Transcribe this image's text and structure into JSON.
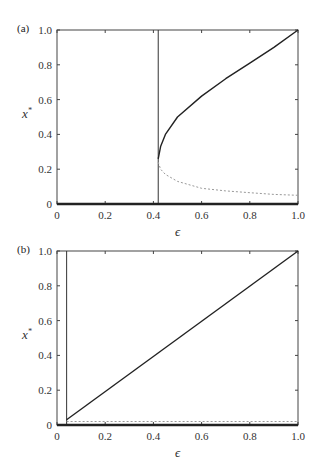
{
  "chart_data": [
    {
      "type": "line",
      "panel_label": "(a)",
      "xlabel": "ϵ",
      "ylabel": "x*",
      "xlim": [
        0,
        1.0
      ],
      "ylim": [
        0,
        1.0
      ],
      "x_ticks": [
        "0",
        "0.2",
        "0.4",
        "0.6",
        "0.8",
        "1.0"
      ],
      "y_ticks": [
        "0",
        "0.2",
        "0.4",
        "0.6",
        "0.8",
        "1.0"
      ],
      "grid": false,
      "vertical_line_x": 0.42,
      "series": [
        {
          "name": "stable branch (solid)",
          "style": "solid",
          "x": [
            0.42,
            0.43,
            0.45,
            0.5,
            0.6,
            0.7,
            0.8,
            0.9,
            1.0
          ],
          "y": [
            0.26,
            0.33,
            0.4,
            0.5,
            0.62,
            0.72,
            0.81,
            0.9,
            1.0
          ]
        },
        {
          "name": "unstable branch (dashed)",
          "style": "dashed",
          "x": [
            0.42,
            0.43,
            0.45,
            0.5,
            0.6,
            0.7,
            0.8,
            0.9,
            1.0
          ],
          "y": [
            0.24,
            0.2,
            0.17,
            0.13,
            0.09,
            0.075,
            0.065,
            0.055,
            0.05
          ]
        },
        {
          "name": "zero branch (solid)",
          "style": "solid",
          "x": [
            0,
            1.0
          ],
          "y": [
            0,
            0
          ]
        }
      ]
    },
    {
      "type": "line",
      "panel_label": "(b)",
      "xlabel": "ϵ",
      "ylabel": "x*",
      "xlim": [
        0,
        1.0
      ],
      "ylim": [
        0,
        1.0
      ],
      "x_ticks": [
        "0",
        "0.2",
        "0.4",
        "0.6",
        "0.8",
        "1.0"
      ],
      "y_ticks": [
        "0",
        "0.2",
        "0.4",
        "0.6",
        "0.8",
        "1.0"
      ],
      "grid": false,
      "vertical_line_x": 0.04,
      "series": [
        {
          "name": "stable branch (solid)",
          "style": "solid",
          "x": [
            0.04,
            1.0
          ],
          "y": [
            0.03,
            1.0
          ]
        },
        {
          "name": "unstable branch (dashed)",
          "style": "dashed",
          "x": [
            0.04,
            1.0
          ],
          "y": [
            0.02,
            0.02
          ]
        },
        {
          "name": "zero branch (solid)",
          "style": "solid",
          "x": [
            0,
            1.0
          ],
          "y": [
            0,
            0
          ]
        }
      ]
    }
  ]
}
